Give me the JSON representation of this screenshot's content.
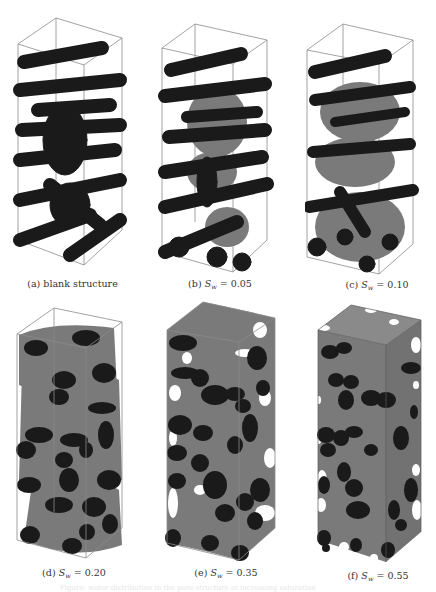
{
  "figure": {
    "panels": [
      {
        "id": "a",
        "label": "(a)",
        "caption": "blank structure",
        "sw_value": null
      },
      {
        "id": "b",
        "label": "(b)",
        "var": "S",
        "sub": "w",
        "eq": " = ",
        "sw_value": "0.05"
      },
      {
        "id": "c",
        "label": "(c)",
        "var": "S",
        "sub": "w",
        "eq": " = ",
        "sw_value": "0.10"
      },
      {
        "id": "d",
        "label": "(d)",
        "var": "S",
        "sub": "w",
        "eq": " = ",
        "sw_value": "0.20"
      },
      {
        "id": "e",
        "label": "(e)",
        "var": "S",
        "sub": "w",
        "eq": " = ",
        "sw_value": "0.35"
      },
      {
        "id": "f",
        "label": "(f)",
        "var": "S",
        "sub": "w",
        "eq": " = ",
        "sw_value": "0.55"
      }
    ],
    "figure_caption_faded": "Figure: water distribution in the pore structure at increasing saturation"
  },
  "colors": {
    "solid_fibers": "#1a1a1a",
    "water_phase": "#7a7a7a",
    "box_edges": "#8c8c8c",
    "background": "#ffffff"
  }
}
